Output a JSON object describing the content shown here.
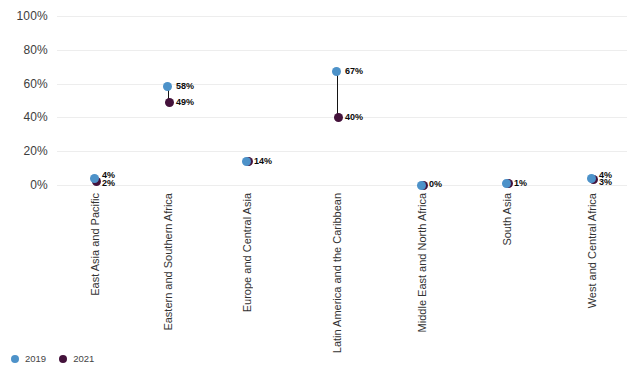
{
  "chart_data": {
    "type": "scatter",
    "subtype": "dumbbell-dot-plot",
    "categories": [
      "East Asia and Pacific",
      "Eastern and Southern Africa",
      "Europe and Central Asia",
      "Latin America and the Caribbean",
      "Middle East and North Africa",
      "South Asia",
      "West and Central Africa"
    ],
    "series": [
      {
        "name": "2019",
        "color": "#4d92c9",
        "values": [
          4,
          58,
          14,
          67,
          0,
          1,
          4
        ]
      },
      {
        "name": "2021",
        "color": "#44123b",
        "values": [
          2,
          49,
          14,
          40,
          0,
          1,
          3
        ]
      }
    ],
    "value_labels": [
      [
        "4%",
        "2%"
      ],
      [
        "58%",
        "49%"
      ],
      [
        "14%"
      ],
      [
        "67%",
        "40%"
      ],
      [
        "0%"
      ],
      [
        "1%"
      ],
      [
        "4%",
        "3%"
      ]
    ],
    "yticks": [
      {
        "value": 0,
        "label": "0%"
      },
      {
        "value": 20,
        "label": "20%"
      },
      {
        "value": 40,
        "label": "40%"
      },
      {
        "value": 60,
        "label": "60%"
      },
      {
        "value": 80,
        "label": "80%"
      },
      {
        "value": 100,
        "label": "100%"
      }
    ],
    "ylim": [
      0,
      100
    ],
    "grid": true,
    "legend_position": "bottom-left"
  },
  "colors": {
    "background": "#ffffff",
    "grid": "#ededed",
    "connector": "#141414",
    "series_2019": "#4d92c9",
    "series_2021": "#44123b"
  }
}
